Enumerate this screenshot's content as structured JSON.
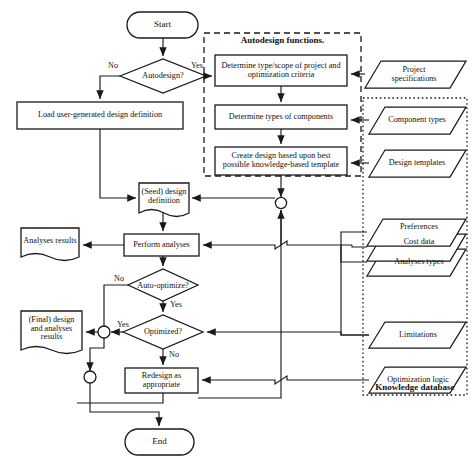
{
  "diagram": {
    "groups": [
      {
        "name": "autodesign-functions",
        "label": "Autodesign functions.",
        "border": "dashed"
      },
      {
        "name": "knowledge-database",
        "label": "Knowledge database",
        "border": "dotted"
      }
    ],
    "nodes": [
      {
        "id": "start",
        "type": "terminal",
        "label": "Start"
      },
      {
        "id": "autodesign",
        "type": "decision",
        "label": "Autodesign?"
      },
      {
        "id": "load-def",
        "type": "process",
        "label": "Load user-generated design definition"
      },
      {
        "id": "determine-type",
        "type": "process",
        "label": "Determine type/scope of project and optimization criteria"
      },
      {
        "id": "determine-comp",
        "type": "process",
        "label": "Determine types of components"
      },
      {
        "id": "create-design",
        "type": "process",
        "label": "Create design based upon best possible knowledge-based template"
      },
      {
        "id": "seed-def",
        "type": "document",
        "label": "(Seed) design definition"
      },
      {
        "id": "perform-analyses",
        "type": "process",
        "label": "Perform analyses"
      },
      {
        "id": "analyses-results",
        "type": "document",
        "label": "Analyses results"
      },
      {
        "id": "auto-optimize",
        "type": "decision",
        "label": "Auto-optimize?"
      },
      {
        "id": "optimized",
        "type": "decision",
        "label": "Optimized?"
      },
      {
        "id": "final-results",
        "type": "document",
        "label": "(Final) design and analyses results"
      },
      {
        "id": "redesign",
        "type": "process",
        "label": "Redesign as appropriate"
      },
      {
        "id": "end",
        "type": "terminal",
        "label": "End"
      },
      {
        "id": "project-specs",
        "type": "data",
        "label": "Project specifications"
      },
      {
        "id": "component-types",
        "type": "data",
        "label": "Component types"
      },
      {
        "id": "design-templates",
        "type": "data",
        "label": "Design templates"
      },
      {
        "id": "preferences",
        "type": "data",
        "label": "Preferences"
      },
      {
        "id": "cost-data",
        "type": "data",
        "label": "Cost data"
      },
      {
        "id": "analyses-types",
        "type": "data",
        "label": "Analyses types"
      },
      {
        "id": "limitations",
        "type": "data",
        "label": "Limitations"
      },
      {
        "id": "optimization-logic",
        "type": "data",
        "label": "Optimization logic"
      }
    ],
    "edge_labels": {
      "autodesign_no": "No",
      "autodesign_yes": "Yes",
      "auto_optimize_no": "No",
      "auto_optimize_yes": "Yes",
      "optimized_yes": "Yes",
      "optimized_no": "No"
    },
    "colors": {
      "stroke": "#1a1a1a",
      "text": "#111111",
      "background": "#ffffff"
    }
  }
}
